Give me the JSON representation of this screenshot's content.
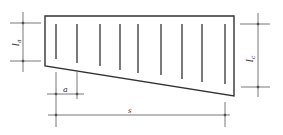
{
  "diagram": {
    "type": "trapezoid-panel-with-bars",
    "stroke_color": "#333333",
    "dim_color": "#555555",
    "shape": {
      "points": [
        [
          45,
          16
        ],
        [
          234,
          16
        ],
        [
          234,
          96
        ],
        [
          45,
          66
        ]
      ]
    },
    "bars": [
      {
        "x": 56,
        "y1": 24,
        "y2": 59
      },
      {
        "x": 77,
        "y1": 24,
        "y2": 63
      },
      {
        "x": 100,
        "y1": 24,
        "y2": 66
      },
      {
        "x": 120,
        "y1": 24,
        "y2": 70
      },
      {
        "x": 138,
        "y1": 24,
        "y2": 73
      },
      {
        "x": 161,
        "y1": 24,
        "y2": 75
      },
      {
        "x": 182,
        "y1": 24,
        "y2": 79
      },
      {
        "x": 202,
        "y1": 24,
        "y2": 82
      },
      {
        "x": 225,
        "y1": 24,
        "y2": 84
      }
    ],
    "labels": {
      "left_dim": "la",
      "right_dim": "lc",
      "spacing": "a",
      "span": "s"
    },
    "left_dim_text": {
      "main": "l",
      "sub": "a"
    },
    "right_dim_text": {
      "main": "l",
      "sub": "c"
    }
  }
}
